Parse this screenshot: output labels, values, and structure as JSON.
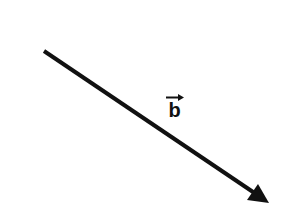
{
  "diagram": {
    "vector": {
      "name": "b",
      "label": "b",
      "start": [
        44,
        51
      ],
      "end": [
        269,
        203
      ],
      "color": "#111111",
      "stroke_width": 4
    },
    "label_position": [
      174.5,
      117
    ]
  }
}
